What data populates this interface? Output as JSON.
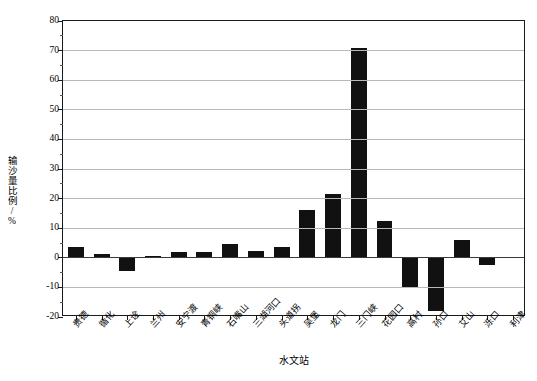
{
  "chart_data": {
    "type": "bar",
    "title": "",
    "xlabel": "水文站",
    "ylabel": "输沙量比例/%",
    "ylim": [
      -20,
      80
    ],
    "yticks": [
      -20,
      -10,
      0,
      10,
      20,
      30,
      40,
      50,
      60,
      70,
      80
    ],
    "ytick_labels": [
      "-20",
      "-10",
      "0",
      "10",
      "20",
      "30",
      "40",
      "50",
      "60",
      "70",
      "80"
    ],
    "grid": true,
    "legend": "none",
    "categories": [
      "贵德",
      "循化",
      "上诠",
      "兰州",
      "安宁渡",
      "青铜峡",
      "石嘴山",
      "三湖河口",
      "头道拐",
      "吴堡",
      "龙门",
      "三门峡",
      "花园口",
      "高村",
      "孙口",
      "艾山",
      "泺口",
      "利津"
    ],
    "values": [
      3.8,
      1.2,
      -4.5,
      0.5,
      1.8,
      1.8,
      4.5,
      2.2,
      3.8,
      16.0,
      21.5,
      71.0,
      12.5,
      -10.0,
      -18.0,
      6.0,
      -2.5,
      0.2
    ],
    "series": [
      {
        "name": "输沙量比例",
        "values": [
          3.8,
          1.2,
          -4.5,
          0.5,
          1.8,
          1.8,
          4.5,
          2.2,
          3.8,
          16.0,
          21.5,
          71.0,
          12.5,
          -10.0,
          -18.0,
          6.0,
          -2.5,
          0.2
        ]
      }
    ],
    "bar_color": "#111111"
  }
}
